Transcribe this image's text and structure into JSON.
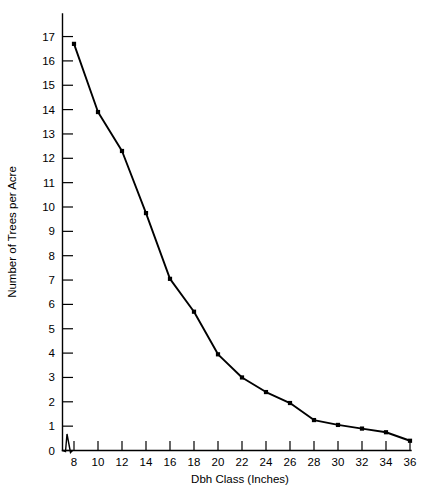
{
  "chart_data": {
    "type": "line",
    "title": "",
    "xlabel": "Dbh Class (Inches)",
    "ylabel": "Number of Trees per Acre",
    "x": [
      8,
      10,
      12,
      14,
      16,
      18,
      20,
      22,
      24,
      26,
      28,
      30,
      32,
      34,
      36
    ],
    "values": [
      16.7,
      13.9,
      12.3,
      9.75,
      7.05,
      5.7,
      3.95,
      3.0,
      2.4,
      1.95,
      1.25,
      1.05,
      0.9,
      0.75,
      0.4
    ],
    "series": [
      {
        "name": "Number of Trees per Acre",
        "values": [
          16.7,
          13.9,
          12.3,
          9.75,
          7.05,
          5.7,
          3.95,
          3.0,
          2.4,
          1.95,
          1.25,
          1.05,
          0.9,
          0.75,
          0.4
        ]
      }
    ],
    "xticks": [
      "8",
      "10",
      "12",
      "14",
      "16",
      "18",
      "20",
      "22",
      "24",
      "26",
      "28",
      "30",
      "32",
      "34",
      "36"
    ],
    "yticks": [
      "0",
      "1",
      "2",
      "3",
      "4",
      "5",
      "6",
      "7",
      "8",
      "9",
      "10",
      "11",
      "12",
      "13",
      "14",
      "15",
      "16",
      "17"
    ],
    "xlim": [
      8,
      36
    ],
    "ylim": [
      0,
      17
    ],
    "grid": false,
    "legend": false,
    "legend_position": "none",
    "axis_break": "x-axis zigzag between origin and first tick",
    "line_color": "#000000",
    "marker_color": "#000000",
    "background_color": "#ffffff"
  }
}
